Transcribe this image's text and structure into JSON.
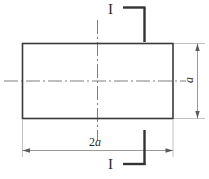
{
  "diagram": {
    "type": "engineering-section-view",
    "shape": {
      "name": "rectangle",
      "width_label": "2a",
      "height_label": "a",
      "aspect_ratio": "2:1"
    },
    "section_marks": {
      "top_label": "I",
      "bottom_label": "I",
      "cut_name": "I-I"
    },
    "dimensions": [
      {
        "id": "width",
        "label": "2a",
        "label_prefix": "2",
        "label_var": "a",
        "orientation": "horizontal",
        "position": "below"
      },
      {
        "id": "height",
        "label": "a",
        "label_prefix": "",
        "label_var": "a",
        "orientation": "vertical",
        "position": "right"
      }
    ],
    "centerlines": [
      {
        "id": "horizontal-centerline",
        "orientation": "horizontal",
        "style": "dash-dot"
      },
      {
        "id": "vertical-centerline",
        "orientation": "vertical",
        "style": "dash-dot"
      }
    ],
    "colors": {
      "outline": "#3a3a3a",
      "centerline": "#6b6b6b",
      "dimension": "#8a8a8a",
      "section_mark": "#3a3a3a",
      "text": "#2b2b2b",
      "background": "#ffffff"
    }
  }
}
